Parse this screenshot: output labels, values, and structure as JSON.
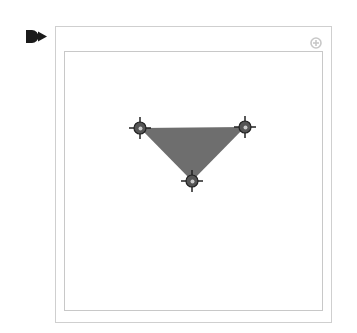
{
  "shape": {
    "type": "triangle",
    "fill_color": "#6e6e6e",
    "vertices": [
      {
        "name": "vertex-top-left",
        "x": 140,
        "y": 128
      },
      {
        "name": "vertex-top-right",
        "x": 245,
        "y": 127
      },
      {
        "name": "vertex-bottom",
        "x": 192,
        "y": 181
      }
    ]
  },
  "handle": {
    "fill_color": "#555555",
    "center_color": "#cccccc",
    "radius": 6
  },
  "colors": {
    "frame_border": "#cfcfcf",
    "icon_color": "#1a1a1a",
    "add_button_color": "#c8c8c8"
  },
  "icons": {
    "marker": "play-marker-icon",
    "add": "add-circle-icon"
  }
}
